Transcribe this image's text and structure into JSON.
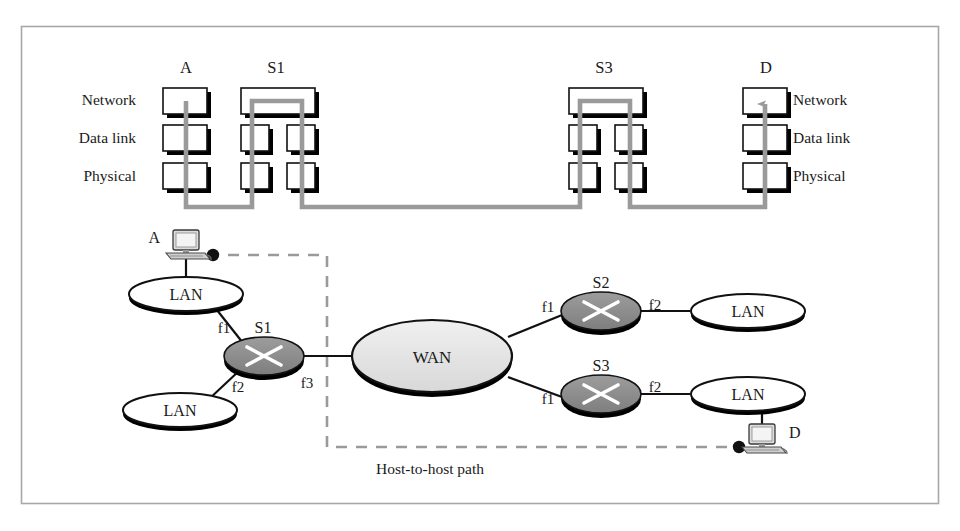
{
  "figure": {
    "frame_color": "#a8a8a8",
    "background": "#ffffff",
    "caption_fragment": ""
  },
  "colors": {
    "path_gray": "#9a9a9a",
    "router_fill": "#8c8c8c",
    "wan_fill": "#e2e2e2",
    "lan_fill": "#ffffff",
    "box_fill": "#ffffff",
    "shadow": "#000000",
    "outline": "#1a1a1a",
    "dash_gray": "#9a9a9a",
    "host_fill": "#d0d0d0"
  },
  "stack_panel": {
    "row_labels_left": [
      "Network",
      "Data link",
      "Physical"
    ],
    "row_labels_right": [
      "Network",
      "Data link",
      "Physical"
    ],
    "nodes": [
      {
        "id": "A",
        "label": "A",
        "kind": "host",
        "columns": 1
      },
      {
        "id": "S1",
        "label": "S1",
        "kind": "switch",
        "columns": 2
      },
      {
        "id": "S3",
        "label": "S3",
        "kind": "switch",
        "columns": 2
      },
      {
        "id": "D",
        "label": "D",
        "kind": "host",
        "columns": 1
      }
    ],
    "arrow_target": "D"
  },
  "network_panel": {
    "hosts": [
      {
        "id": "A",
        "label": "A"
      },
      {
        "id": "D",
        "label": "D"
      }
    ],
    "clouds": [
      {
        "id": "lan-a",
        "label": "LAN"
      },
      {
        "id": "lan-b",
        "label": "LAN"
      },
      {
        "id": "wan",
        "label": "WAN"
      },
      {
        "id": "lan-s2",
        "label": "LAN"
      },
      {
        "id": "lan-s3",
        "label": "LAN"
      }
    ],
    "routers": [
      {
        "id": "S1",
        "label": "S1"
      },
      {
        "id": "S2",
        "label": "S2"
      },
      {
        "id": "S3",
        "label": "S3"
      }
    ],
    "interfaces": [
      {
        "id": "s1-f1",
        "label": "f1",
        "router": "S1"
      },
      {
        "id": "s1-f2",
        "label": "f2",
        "router": "S1"
      },
      {
        "id": "s1-f3",
        "label": "f3",
        "router": "S1"
      },
      {
        "id": "s2-f1",
        "label": "f1",
        "router": "S2"
      },
      {
        "id": "s2-f2",
        "label": "f2",
        "router": "S2"
      },
      {
        "id": "s3-f1",
        "label": "f1",
        "router": "S3"
      },
      {
        "id": "s3-f2",
        "label": "f2",
        "router": "S3"
      }
    ],
    "path_annotation": "Host-to-host path"
  }
}
